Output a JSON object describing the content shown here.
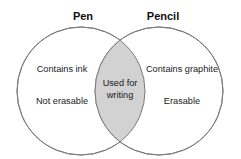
{
  "diagram": {
    "type": "venn",
    "sets": 2,
    "background_color": "#ffffff",
    "outline_color": "#7a7a7a",
    "intersection_fill_color": "#d2d2d2",
    "text_color": "#1a1a1a",
    "left": {
      "title": "Pen",
      "items": [
        "Contains ink",
        "Not erasable"
      ]
    },
    "right": {
      "title": "Pencil",
      "items": [
        "Contains graphite",
        "Erasable"
      ]
    },
    "intersection": {
      "lines": [
        "Used for",
        "writing"
      ]
    }
  }
}
